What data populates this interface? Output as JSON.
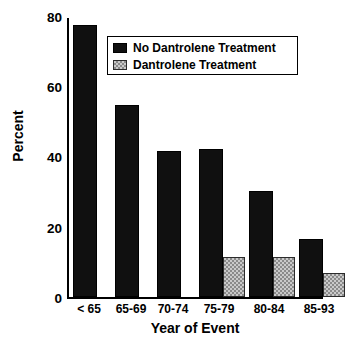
{
  "chart_data": {
    "type": "bar",
    "title": "",
    "xlabel": "Year of Event",
    "ylabel": "Percent",
    "categories": [
      "< 65",
      "65-69",
      "70-74",
      "75-79",
      "80-84",
      "85-93"
    ],
    "series": [
      {
        "name": "No Dantrolene Treatment",
        "color": "#101010",
        "pattern": "solid",
        "values": [
          78,
          55,
          42,
          42.5,
          30.5,
          16.5
        ]
      },
      {
        "name": "Dantrolene Treatment",
        "color": "#c9c9c9",
        "pattern": "checkered",
        "values": [
          null,
          null,
          null,
          11.5,
          11.5,
          7
        ]
      }
    ],
    "ylim": [
      0,
      80
    ],
    "yticks": [
      80,
      60,
      40,
      20,
      0
    ],
    "ytick_labels": [
      "80",
      "60",
      "40",
      "20",
      "0"
    ],
    "grid": false,
    "legend_position": "top-center"
  },
  "legend": {
    "entries": [
      {
        "label": "No Dantrolene Treatment",
        "swatch": "black-square-swatch"
      },
      {
        "label": "Dantrolene Treatment",
        "swatch": "checkered-square-swatch"
      }
    ]
  },
  "caption": {
    "text": ""
  }
}
